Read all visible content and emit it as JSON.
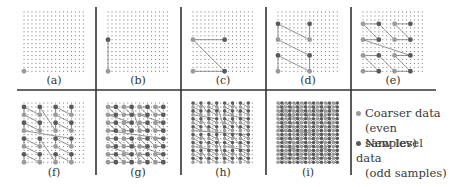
{
  "figure": {
    "panels": [
      {
        "id": "a",
        "label": "(a)",
        "level": 0
      },
      {
        "id": "b",
        "label": "(b)",
        "level": 1
      },
      {
        "id": "c",
        "label": "(c)",
        "level": 2
      },
      {
        "id": "d",
        "label": "(d)",
        "level": 3
      },
      {
        "id": "e",
        "label": "(e)",
        "level": 4
      },
      {
        "id": "f",
        "label": "(f)",
        "level": 5
      },
      {
        "id": "g",
        "label": "(g)",
        "level": 6
      },
      {
        "id": "h",
        "label": "(h)",
        "level": 7
      },
      {
        "id": "i",
        "label": "(i)",
        "level": 8
      }
    ],
    "grid_size": 16,
    "curve": "z-order",
    "colors": {
      "coarse": "#9a9a9a",
      "new": "#5a5a5a",
      "grid_dot": "#8a8a8a",
      "line": "#7a7a7a",
      "divider": "#333333"
    }
  },
  "legend": {
    "coarse": {
      "line1": "Coarser data",
      "line2": "(even samples)"
    },
    "new": {
      "line1": "New level data",
      "line2": "(odd samples)"
    }
  }
}
